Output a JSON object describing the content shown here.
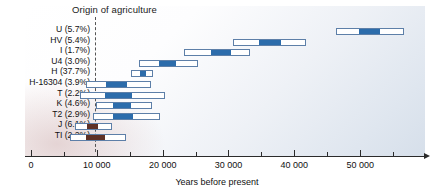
{
  "chart_data": {
    "type": "bar",
    "orientation": "horizontal",
    "subtype": "range-interval",
    "title": "",
    "xlabel": "Years before present",
    "ylabel": "",
    "xlim": [
      0,
      59700
    ],
    "grid": false,
    "legend": null,
    "annotations": [
      {
        "name": "origin-of-agriculture",
        "label": "Origin of agriculture",
        "x": 10000,
        "style": "dashed-vertical-line"
      }
    ],
    "xticks_major": [
      0,
      10000,
      20000,
      30000,
      40000,
      50000
    ],
    "xticklabels": [
      "0",
      "10 000",
      "20 000",
      "30 000",
      "40 000",
      "50 000"
    ],
    "xticks_minor": [
      5000,
      15000,
      25000,
      35000,
      45000,
      55000
    ],
    "categories": [
      "U (5.7%)",
      "HV (5.4%)",
      "I (1.7%)",
      "U4 (3.0%)",
      "H (37.7%)",
      "H-16304 (3.9%)",
      "T (2.2%)",
      "K (4.6%)",
      "T2 (2.9%)",
      "J (6.1%)",
      "TI (2.2%)"
    ],
    "rows": [
      {
        "label": "U (5.7%)",
        "ci_low": 46300,
        "ci_high": 56600,
        "best_low": 49800,
        "best_high": 53000,
        "color": "blue"
      },
      {
        "label": "HV (5.4%)",
        "ci_low": 30700,
        "ci_high": 41700,
        "best_low": 34600,
        "best_high": 38000,
        "color": "blue"
      },
      {
        "label": "I (1.7%)",
        "ci_low": 23300,
        "ci_high": 33200,
        "best_low": 27300,
        "best_high": 30400,
        "color": "blue"
      },
      {
        "label": "U4 (3.0%)",
        "ci_low": 16400,
        "ci_high": 25300,
        "best_low": 19400,
        "best_high": 22000,
        "color": "blue"
      },
      {
        "label": "H (37.7%)",
        "ci_low": 15200,
        "ci_high": 18500,
        "best_low": 16500,
        "best_high": 17400,
        "color": "blue"
      },
      {
        "label": "H-16304 (3.9%)",
        "ci_low": 8400,
        "ci_high": 18300,
        "best_low": 11400,
        "best_high": 14600,
        "color": "blue"
      },
      {
        "label": "T (2.2%)",
        "ci_low": 7400,
        "ci_high": 20400,
        "best_low": 11200,
        "best_high": 15400,
        "color": "blue"
      },
      {
        "label": "K (4.6%)",
        "ci_low": 9900,
        "ci_high": 18400,
        "best_low": 12400,
        "best_high": 15200,
        "color": "blue"
      },
      {
        "label": "T2 (2.9%)",
        "ci_low": 9400,
        "ci_high": 19600,
        "best_low": 12500,
        "best_high": 15500,
        "color": "blue"
      },
      {
        "label": "J (6.1%)",
        "ci_low": 6700,
        "ci_high": 12300,
        "best_low": 8500,
        "best_high": 10200,
        "color": "brown"
      },
      {
        "label": "TI (2.2%)",
        "ci_low": 5900,
        "ci_high": 14400,
        "best_low": 8300,
        "best_high": 11200,
        "color": "brown"
      }
    ],
    "colors": {
      "interval_outline": "#5d7fa8",
      "interval_fill": "#ffffff",
      "highlight_blue": "#2c6cab",
      "highlight_brown": "#5e3126",
      "axis": "#2b2b2b",
      "text": "#111111"
    }
  }
}
